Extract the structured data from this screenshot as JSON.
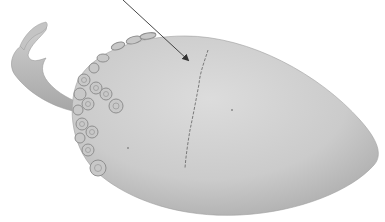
{
  "image": {
    "subject": "ceramic squid-shaped object with suckers and curled tentacle",
    "background_color": "#ffffff",
    "body_color": "#c9c9c9",
    "shadow_color": "#a8a8a8",
    "highlight_color": "#dcdcdc",
    "crack_color": "#6e6e6e",
    "arrow_color": "#333333"
  },
  "annotation": {
    "type": "arrow",
    "points_to": "crack",
    "start": [
      123,
      0
    ],
    "end": [
      190,
      62
    ]
  }
}
